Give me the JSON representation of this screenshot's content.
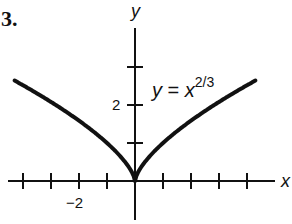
{
  "problem_number": "3.",
  "chart_data": {
    "type": "line",
    "title": "",
    "function": "y = x^(2/3)",
    "annotation": {
      "lhs": "y",
      "eq": " = ",
      "base": "x",
      "exponent": "2/3"
    },
    "xlabel": "x",
    "ylabel": "y",
    "xlim": [
      -4.3,
      4.3
    ],
    "ylim": [
      -1.0,
      4.1
    ],
    "x_ticks": [
      -4,
      -3,
      -2,
      -1,
      1,
      2,
      3,
      4
    ],
    "y_ticks": [
      1,
      2,
      3
    ],
    "x_tick_labels": [
      {
        "value": -2,
        "label": "−2"
      }
    ],
    "y_tick_labels": [
      {
        "value": 2,
        "label": "2"
      }
    ],
    "grid": false,
    "legend": null,
    "series": [
      {
        "name": "y = x^(2/3)",
        "x": [
          -4.3,
          -4,
          -3,
          -2,
          -1,
          -0.5,
          -0.1,
          0,
          0.1,
          0.5,
          1,
          2,
          3,
          4,
          4.3
        ],
        "y": [
          2.65,
          2.52,
          2.08,
          1.59,
          1.0,
          0.63,
          0.22,
          0,
          0.22,
          0.63,
          1.0,
          1.59,
          2.08,
          2.52,
          2.65
        ]
      }
    ],
    "color": "#111111"
  },
  "layout": {
    "origin_px": [
      135,
      181
    ],
    "x_unit_px": 28,
    "y_unit_px": 38
  }
}
